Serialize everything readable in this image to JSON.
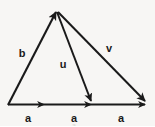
{
  "diagram": {
    "type": "vector-diagram",
    "background_color": "#f7f6f4",
    "stroke_color": "#1a1a1a",
    "label_color": "#1a1a1a",
    "canvas": {
      "width": 155,
      "height": 126
    },
    "points": {
      "origin": {
        "x": 8,
        "y": 105
      },
      "apex": {
        "x": 56,
        "y": 11
      },
      "mid_first": {
        "x": 45,
        "y": 104
      },
      "mid_second": {
        "x": 92,
        "y": 104
      },
      "right_end": {
        "x": 147,
        "y": 104
      }
    },
    "vectors": [
      {
        "name": "b",
        "label": "b",
        "from": {
          "x": 8,
          "y": 105
        },
        "to": {
          "x": 56,
          "y": 11
        },
        "arrowhead": "end",
        "label_pos": {
          "x": 22,
          "y": 53
        }
      },
      {
        "name": "u",
        "label": "u",
        "from": {
          "x": 56,
          "y": 11
        },
        "to": {
          "x": 92,
          "y": 104
        },
        "arrowhead": "end",
        "label_pos": {
          "x": 63,
          "y": 64
        }
      },
      {
        "name": "v",
        "label": "v",
        "from": {
          "x": 56,
          "y": 11
        },
        "to": {
          "x": 147,
          "y": 104
        },
        "arrowhead": "end",
        "label_pos": {
          "x": 109,
          "y": 48
        }
      },
      {
        "name": "a-1",
        "label": "a",
        "from": {
          "x": 8,
          "y": 105
        },
        "to": {
          "x": 45,
          "y": 104
        },
        "arrowhead": "end",
        "label_pos": {
          "x": 28,
          "y": 118
        }
      },
      {
        "name": "a-2",
        "label": "a",
        "from": {
          "x": 45,
          "y": 104
        },
        "to": {
          "x": 92,
          "y": 104
        },
        "arrowhead": "end",
        "label_pos": {
          "x": 74,
          "y": 118
        }
      },
      {
        "name": "a-3",
        "label": "a",
        "from": {
          "x": 92,
          "y": 104
        },
        "to": {
          "x": 147,
          "y": 104
        },
        "arrowhead": "end",
        "label_pos": {
          "x": 121,
          "y": 118
        }
      }
    ],
    "artifacts": [
      {
        "name": "faint-a-mark",
        "text": "a",
        "x": 74,
        "y": 125
      }
    ]
  }
}
